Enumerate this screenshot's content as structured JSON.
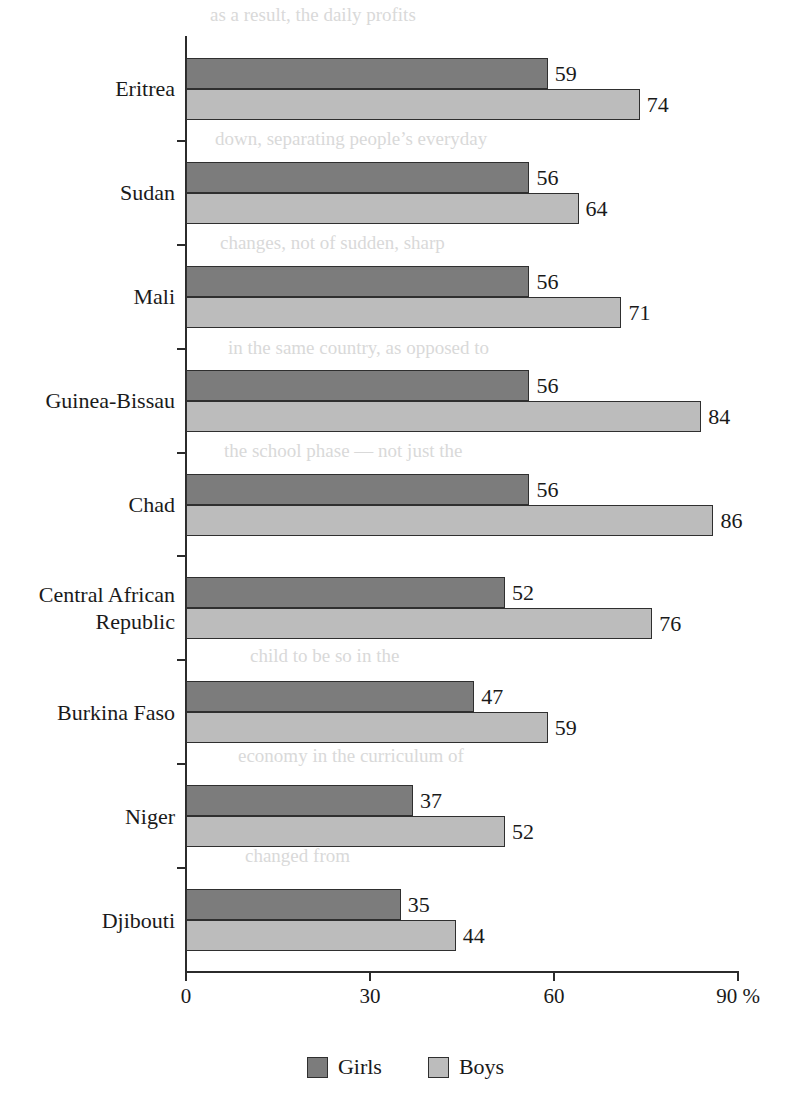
{
  "chart_data": {
    "type": "bar",
    "orientation": "horizontal",
    "title": "",
    "subtitle": "",
    "xlabel": "",
    "ylabel": "",
    "xlim": [
      0,
      90
    ],
    "xticks": [
      0,
      30,
      60,
      90
    ],
    "xtick_labels": [
      "0",
      "30",
      "60",
      "90 %"
    ],
    "unit_suffix": "%",
    "grid": false,
    "legend_position": "bottom-center",
    "categories": [
      "Eritrea",
      "Sudan",
      "Mali",
      "Guinea-Bissau",
      "Chad",
      "Central African\nRepublic",
      "Burkina Faso",
      "Niger",
      "Djibouti"
    ],
    "series": [
      {
        "name": "Girls",
        "color": "#7c7c7c",
        "values": [
          59,
          56,
          56,
          56,
          56,
          52,
          47,
          37,
          35
        ]
      },
      {
        "name": "Boys",
        "color": "#bcbcbc",
        "values": [
          74,
          64,
          71,
          84,
          86,
          76,
          59,
          52,
          44
        ]
      }
    ],
    "data_labels": [
      {
        "category": "Eritrea",
        "girls": "59",
        "boys": "74"
      },
      {
        "category": "Sudan",
        "girls": "56",
        "boys": "64"
      },
      {
        "category": "Mali",
        "girls": "56",
        "boys": "71"
      },
      {
        "category": "Guinea-Bissau",
        "girls": "56",
        "boys": "84"
      },
      {
        "category": "Chad",
        "girls": "56",
        "boys": "86"
      },
      {
        "category": "Central African Republic",
        "girls": "52",
        "boys": "76"
      },
      {
        "category": "Burkina Faso",
        "girls": "47",
        "boys": "59"
      },
      {
        "category": "Niger",
        "girls": "37",
        "boys": "52"
      },
      {
        "category": "Djibouti",
        "girls": "35",
        "boys": "44"
      }
    ]
  },
  "legend": {
    "items": [
      {
        "label": "Girls",
        "color": "#7c7c7c"
      },
      {
        "label": "Boys",
        "color": "#bcbcbc"
      }
    ]
  },
  "axis": {
    "x_tick_labels": [
      "0",
      "30",
      "60",
      "90 %"
    ]
  },
  "page_bleed": {
    "lines": [
      "as a result, the daily profits",
      "down, separating people’s everyday",
      "changes, not of sudden, sharp",
      "in the same country, as opposed to",
      "the school phase — not just the",
      "child to be so in the",
      "economy in the curriculum of",
      "changed from"
    ]
  }
}
